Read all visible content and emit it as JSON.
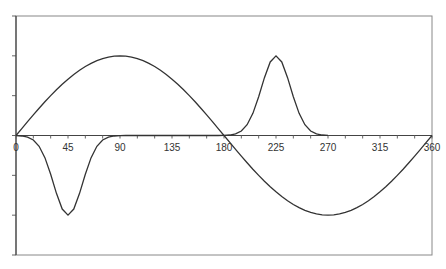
{
  "chart_data": {
    "type": "line",
    "title": "",
    "xlabel": "",
    "ylabel": "",
    "xlim": [
      0,
      360
    ],
    "ylim": [
      -1.5,
      1.5
    ],
    "x_ticks": [
      0,
      45,
      90,
      135,
      180,
      225,
      270,
      315,
      360
    ],
    "x_tick_labels": [
      "0",
      "45",
      "90",
      "135",
      "180",
      "225",
      "270",
      "315",
      "360"
    ],
    "x_minor_tick_step": 15,
    "y_ticks": [
      -1.5,
      -1,
      -0.5,
      0,
      0.5,
      1,
      1.5
    ],
    "y_tick_labels_visible": false,
    "grid": false,
    "legend": null,
    "line_color": "#333333",
    "x": [
      0,
      5,
      10,
      15,
      20,
      25,
      30,
      35,
      40,
      45,
      50,
      55,
      60,
      65,
      70,
      75,
      80,
      85,
      90,
      95,
      100,
      105,
      110,
      115,
      120,
      125,
      130,
      135,
      140,
      145,
      150,
      155,
      160,
      165,
      170,
      175,
      180,
      185,
      190,
      195,
      200,
      205,
      210,
      215,
      220,
      225,
      230,
      235,
      240,
      245,
      250,
      255,
      260,
      265,
      270,
      275,
      280,
      285,
      290,
      295,
      300,
      305,
      310,
      315,
      320,
      325,
      330,
      335,
      340,
      345,
      350,
      355,
      360
    ],
    "series": [
      {
        "name": "sine",
        "values": [
          0,
          0.087,
          0.174,
          0.259,
          0.342,
          0.423,
          0.5,
          0.574,
          0.643,
          0.707,
          0.766,
          0.819,
          0.866,
          0.906,
          0.94,
          0.966,
          0.985,
          0.996,
          1,
          0.996,
          0.985,
          0.966,
          0.94,
          0.906,
          0.866,
          0.819,
          0.766,
          0.707,
          0.643,
          0.574,
          0.5,
          0.423,
          0.342,
          0.259,
          0.174,
          0.087,
          0,
          -0.087,
          -0.174,
          -0.259,
          -0.342,
          -0.423,
          -0.5,
          -0.574,
          -0.643,
          -0.707,
          -0.766,
          -0.819,
          -0.866,
          -0.906,
          -0.94,
          -0.966,
          -0.985,
          -0.996,
          -1,
          -0.996,
          -0.985,
          -0.966,
          -0.94,
          -0.906,
          -0.866,
          -0.819,
          -0.766,
          -0.707,
          -0.643,
          -0.574,
          -0.5,
          -0.423,
          -0.342,
          -0.259,
          -0.174,
          -0.087,
          0
        ]
      },
      {
        "name": "gaussian-pulses",
        "values": [
          -0.002,
          -0.006,
          -0.02,
          -0.056,
          -0.135,
          -0.278,
          -0.487,
          -0.726,
          -0.923,
          -1,
          -0.923,
          -0.726,
          -0.487,
          -0.278,
          -0.135,
          -0.056,
          -0.02,
          -0.006,
          -0.002,
          0,
          0,
          0,
          0,
          0,
          0,
          0,
          0,
          0,
          0,
          0,
          0,
          0,
          0,
          0,
          0,
          0,
          0.002,
          0.006,
          0.02,
          0.056,
          0.135,
          0.278,
          0.487,
          0.726,
          0.923,
          1,
          0.923,
          0.726,
          0.487,
          0.278,
          0.135,
          0.056,
          0.02,
          0.006,
          0.002,
          null,
          null,
          null,
          null,
          null,
          null,
          null,
          null,
          null,
          null,
          null,
          null,
          null,
          null,
          null,
          null,
          null,
          null
        ]
      }
    ]
  },
  "plot_area": {
    "left": 16,
    "top": 16,
    "right": 432,
    "bottom": 255,
    "frame_color": "#888888",
    "axis_color": "#444444"
  }
}
